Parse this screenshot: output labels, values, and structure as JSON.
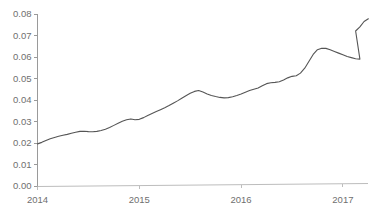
{
  "chart_data": {
    "type": "line",
    "title": "",
    "subtitle": "",
    "xlabel": "",
    "ylabel": "",
    "grid": false,
    "legend": "none",
    "xlim": [
      2014.0,
      2017.25
    ],
    "ylim": [
      0.0,
      0.08
    ],
    "x_tick_labels": [
      "2014",
      "2015",
      "2016",
      "2017"
    ],
    "x_tick_values": [
      2014,
      2015,
      2016,
      2017
    ],
    "y_tick_labels": [
      "0.00",
      "0.01",
      "0.02",
      "0.03",
      "0.04",
      "0.05",
      "0.06",
      "0.07",
      "0.08"
    ],
    "y_tick_values": [
      0.0,
      0.01,
      0.02,
      0.03,
      0.04,
      0.05,
      0.06,
      0.07,
      0.08
    ],
    "series": [
      {
        "name": "series-1",
        "color": "#555555",
        "x": [
          2014.0,
          2014.042,
          2014.083,
          2014.125,
          2014.167,
          2014.208,
          2014.25,
          2014.292,
          2014.333,
          2014.375,
          2014.417,
          2014.458,
          2014.5,
          2014.542,
          2014.583,
          2014.625,
          2014.667,
          2014.708,
          2014.75,
          2014.792,
          2014.833,
          2014.875,
          2014.917,
          2014.958,
          2015.0,
          2015.042,
          2015.083,
          2015.125,
          2015.167,
          2015.208,
          2015.25,
          2015.292,
          2015.333,
          2015.375,
          2015.417,
          2015.458,
          2015.5,
          2015.542,
          2015.583,
          2015.625,
          2015.667,
          2015.708,
          2015.75,
          2015.792,
          2015.833,
          2015.875,
          2015.917,
          2015.958,
          2016.0,
          2016.042,
          2016.083,
          2016.125,
          2016.167,
          2016.208,
          2016.25,
          2016.292,
          2016.333,
          2016.375,
          2016.417,
          2016.458,
          2016.5,
          2016.542,
          2016.583,
          2016.625,
          2016.667,
          2016.708,
          2016.75,
          2016.792,
          2016.833,
          2016.875,
          2016.917,
          2016.958,
          2017.0,
          2017.042,
          2017.083,
          2017.125,
          2017.167,
          2017.208
        ],
        "y": [
          0.0196,
          0.0203,
          0.0212,
          0.022,
          0.0226,
          0.0231,
          0.0236,
          0.024,
          0.0245,
          0.025,
          0.0254,
          0.0255,
          0.0253,
          0.0252,
          0.0254,
          0.0258,
          0.0264,
          0.0272,
          0.0282,
          0.0292,
          0.0301,
          0.0308,
          0.0312,
          0.0308,
          0.031,
          0.0318,
          0.0328,
          0.0337,
          0.0346,
          0.0355,
          0.0364,
          0.0374,
          0.0385,
          0.0396,
          0.0408,
          0.042,
          0.0431,
          0.044,
          0.0444,
          0.0437,
          0.0428,
          0.0421,
          0.0416,
          0.0412,
          0.041,
          0.0411,
          0.0415,
          0.0421,
          0.0428,
          0.0436,
          0.0444,
          0.045,
          0.0456,
          0.0466,
          0.0476,
          0.048,
          0.0482,
          0.0485,
          0.0493,
          0.0503,
          0.051,
          0.0513,
          0.0525,
          0.0548,
          0.058,
          0.0612,
          0.0634,
          0.0641,
          0.064,
          0.0634,
          0.0626,
          0.0618,
          0.061,
          0.0602,
          0.0597,
          0.0592,
          0.059,
          0.0586
        ]
      }
    ],
    "series_extension": {
      "note": "continuation of the same single series to the right edge",
      "x": [
        2016.0,
        2016.042,
        2016.083,
        2016.125,
        2016.167,
        2016.208,
        2016.25,
        2016.292,
        2016.333,
        2016.375,
        2016.417,
        2016.458,
        2016.5,
        2016.542,
        2016.583,
        2016.625,
        2016.667,
        2016.708,
        2016.75,
        2016.792,
        2016.833,
        2016.875,
        2016.917,
        2016.958,
        2017.0,
        2017.042,
        2017.083,
        2017.125,
        2017.167,
        2017.208
      ],
      "y": [
        0.0612,
        0.0634,
        0.0641,
        0.064,
        0.0634,
        0.0627,
        0.062,
        0.0613,
        0.0606,
        0.0601,
        0.0597,
        0.0593,
        0.059,
        0.0586,
        0.0578,
        0.0572,
        0.0568,
        0.0566,
        0.0568,
        0.0572,
        0.0583,
        0.0604,
        0.0632,
        0.066,
        0.0685,
        0.0707,
        0.0718,
        0.0721,
        0.0717,
        0.0719
      ]
    },
    "annotations": [],
    "data_points_note": "Monthly observations from January 2014 through approximately March 2017; values rise from about 0.0196 to about 0.078 with local peaks near 0.0444 (mid 2015) and 0.0641 (early 2016) and a trough near 0.0566 (late 2016)."
  },
  "axes": {
    "y_ticks": [
      {
        "label": "0.08",
        "value": 0.08
      },
      {
        "label": "0.07",
        "value": 0.07
      },
      {
        "label": "0.06",
        "value": 0.06
      },
      {
        "label": "0.05",
        "value": 0.05
      },
      {
        "label": "0.04",
        "value": 0.04
      },
      {
        "label": "0.03",
        "value": 0.03
      },
      {
        "label": "0.02",
        "value": 0.02
      },
      {
        "label": "0.01",
        "value": 0.01
      },
      {
        "label": "0.00",
        "value": 0.0
      }
    ],
    "x_ticks": [
      {
        "label": "2014",
        "value": 2014
      },
      {
        "label": "2015",
        "value": 2015
      },
      {
        "label": "2016",
        "value": 2016
      },
      {
        "label": "2017",
        "value": 2017
      }
    ]
  },
  "colors": {
    "line": "#555555",
    "y_axis": "#9a9a9a",
    "x_axis": "#bdbdbd",
    "tick_text": "#6f6f6f",
    "background": "#ffffff"
  }
}
